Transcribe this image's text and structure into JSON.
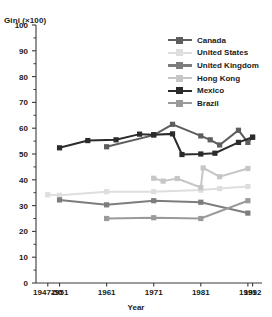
{
  "chart_data": {
    "type": "line",
    "title": "",
    "xlabel": "Year",
    "ylabel": "Gini (×100)",
    "ylim": [
      0,
      100
    ],
    "ytick_step": 10,
    "yticks": [
      0,
      10,
      20,
      30,
      40,
      50,
      60,
      70,
      80,
      90,
      100
    ],
    "minor_ytick_step": 5,
    "grid": false,
    "legend_position": "top-right",
    "xtick_labels": [
      "1947-50",
      "1951",
      "1961",
      "1971",
      "1981",
      "1991",
      "1992"
    ],
    "xtick_values": [
      1948.5,
      1951,
      1961,
      1971,
      1981,
      1991,
      1992
    ],
    "xlim": [
      1946,
      1994
    ],
    "series": [
      {
        "name": "Canada",
        "color": "#5e5e5e",
        "points": [
          {
            "x": 1961,
            "y": 52.8
          },
          {
            "x": 1971,
            "y": 57.3
          },
          {
            "x": 1975,
            "y": 61.5
          },
          {
            "x": 1981,
            "y": 57.0
          },
          {
            "x": 1983,
            "y": 55.5
          },
          {
            "x": 1985,
            "y": 53.5
          },
          {
            "x": 1989,
            "y": 59.2
          },
          {
            "x": 1991,
            "y": 54.5
          },
          {
            "x": 1992,
            "y": 56.5
          }
        ]
      },
      {
        "name": "United States",
        "color": "#dedede",
        "points": [
          {
            "x": 1948.5,
            "y": 34.2
          },
          {
            "x": 1951,
            "y": 34.0
          },
          {
            "x": 1961,
            "y": 35.4
          },
          {
            "x": 1971,
            "y": 35.4
          },
          {
            "x": 1981,
            "y": 36.0
          },
          {
            "x": 1985,
            "y": 36.6
          },
          {
            "x": 1991,
            "y": 37.4
          }
        ]
      },
      {
        "name": "United Kingdom",
        "color": "#7d7d7d",
        "points": [
          {
            "x": 1951,
            "y": 32.2
          },
          {
            "x": 1961,
            "y": 30.3
          },
          {
            "x": 1971,
            "y": 31.9
          },
          {
            "x": 1981,
            "y": 31.3
          },
          {
            "x": 1991,
            "y": 27.1
          }
        ]
      },
      {
        "name": "Hong Kong",
        "color": "#c6c6c6",
        "points": [
          {
            "x": 1971,
            "y": 40.6
          },
          {
            "x": 1973,
            "y": 39.5
          },
          {
            "x": 1976,
            "y": 40.5
          },
          {
            "x": 1981,
            "y": 37.0
          },
          {
            "x": 1981.5,
            "y": 44.6
          },
          {
            "x": 1985,
            "y": 41.2
          },
          {
            "x": 1991,
            "y": 44.4
          }
        ]
      },
      {
        "name": "Mexico",
        "color": "#2b2b2b",
        "points": [
          {
            "x": 1951,
            "y": 52.4
          },
          {
            "x": 1957,
            "y": 55.2
          },
          {
            "x": 1963,
            "y": 55.5
          },
          {
            "x": 1968,
            "y": 57.7
          },
          {
            "x": 1971,
            "y": 57.5
          },
          {
            "x": 1975,
            "y": 57.8
          },
          {
            "x": 1977,
            "y": 49.8
          },
          {
            "x": 1981,
            "y": 50.0
          },
          {
            "x": 1984,
            "y": 50.3
          },
          {
            "x": 1989,
            "y": 54.5
          },
          {
            "x": 1992,
            "y": 56.5
          }
        ]
      },
      {
        "name": "Brazil",
        "color": "#9a9a9a",
        "points": [
          {
            "x": 1961,
            "y": 25.0
          },
          {
            "x": 1971,
            "y": 25.3
          },
          {
            "x": 1981,
            "y": 25.0
          },
          {
            "x": 1991,
            "y": 31.9
          }
        ]
      }
    ]
  },
  "legend": {
    "items": [
      {
        "label": "Canada",
        "color": "#5e5e5e"
      },
      {
        "label": "United States",
        "color": "#dedede"
      },
      {
        "label": "United Kingdom",
        "color": "#7d7d7d"
      },
      {
        "label": "Hong Kong",
        "color": "#c6c6c6"
      },
      {
        "label": "Mexico",
        "color": "#2b2b2b"
      },
      {
        "label": "Brazil",
        "color": "#9a9a9a"
      }
    ]
  },
  "axis": {
    "color": "#3a3a3a"
  }
}
